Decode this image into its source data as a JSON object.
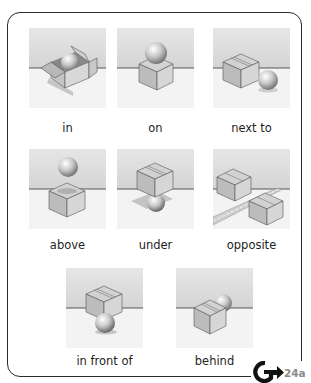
{
  "figure": {
    "items": [
      {
        "id": "in",
        "label": "in",
        "scene": "ball inside open box"
      },
      {
        "id": "on",
        "label": "on",
        "scene": "ball resting on top of box"
      },
      {
        "id": "next-to",
        "label": "next to",
        "scene": "ball beside box"
      },
      {
        "id": "above",
        "label": "above",
        "scene": "ball floating over box"
      },
      {
        "id": "under",
        "label": "under",
        "scene": "ball beneath box"
      },
      {
        "id": "opposite",
        "label": "opposite",
        "scene": "two boxes on opposite sides of a road"
      },
      {
        "id": "in-front-of",
        "label": "in front of",
        "scene": "ball in front of box"
      },
      {
        "id": "behind",
        "label": "behind",
        "scene": "ball behind box"
      }
    ]
  },
  "cross_reference": {
    "icon": "grammar-arrow-icon",
    "letter": "G",
    "target": "24a"
  },
  "colors": {
    "frame": "#2a2a2a",
    "wall": "#dcdcdc",
    "floor": "#f4f4f4",
    "horizon": "#333333",
    "box_light": "#d6d6d6",
    "box_mid": "#bdbdbd",
    "box_dark": "#a6a6a6",
    "ref_text": "#8a8a8a"
  }
}
